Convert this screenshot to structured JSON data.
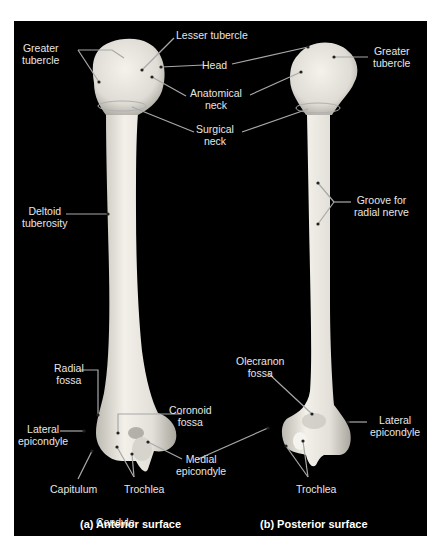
{
  "figure": {
    "panels": [
      {
        "id": "a",
        "caption": "(a) Anterior surface",
        "labels": {
          "greater_tubercle": "Greater\ntubercle",
          "lesser_tubercle": "Lesser tubercle",
          "head": "Head",
          "anatomical_neck": "Anatomical\nneck",
          "deltoid_tuberosity": "Deltoid\ntuberosity",
          "radial_fossa": "Radial\nfossa",
          "lateral_epicondyle": "Lateral\nepicondyle",
          "coronoid_fossa": "Coronoid\nfossa",
          "capitulum": "Capitulum",
          "trochlea": "Trochlea",
          "condyle": "Condyle"
        }
      },
      {
        "id": "b",
        "caption": "(b) Posterior surface",
        "labels": {
          "greater_tubercle": "Greater\ntubercle",
          "groove_radial_nerve": "Groove for\nradial nerve",
          "olecranon_fossa": "Olecranon\nfossa",
          "lateral_epicondyle": "Lateral\nepicondyle",
          "trochlea": "Trochlea"
        }
      }
    ],
    "shared_labels": {
      "surgical_neck": "Surgical\nneck",
      "medial_epicondyle": "Medial\nepicondyle"
    },
    "colors": {
      "background": "#000000",
      "bone": "#e4e2da",
      "bone_shadow": "#b8b6ae",
      "leader_line": "#a8a8a8",
      "label_text": "#e6e6e6",
      "page": "#ffffff"
    }
  }
}
